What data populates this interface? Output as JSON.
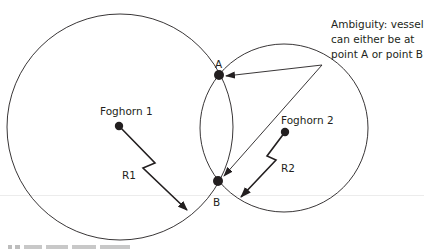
{
  "diagram": {
    "foghorns": [
      {
        "label": "Foghorn 1",
        "radius_label": "R1"
      },
      {
        "label": "Foghorn 2",
        "radius_label": "R2"
      }
    ],
    "points": [
      {
        "label": "A"
      },
      {
        "label": "B"
      }
    ],
    "annotation": {
      "lines": [
        "Ambiguity: vessel",
        "can either be at",
        "point A or point B"
      ]
    },
    "colors": {
      "stroke": "#231f20",
      "text": "#231f20"
    }
  }
}
